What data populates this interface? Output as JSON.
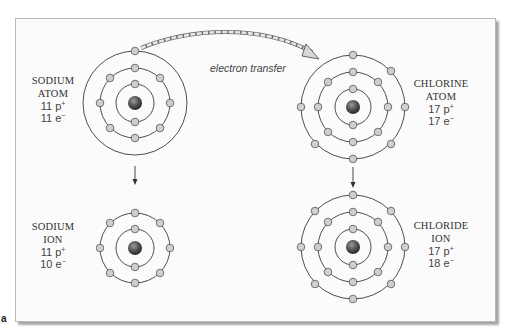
{
  "figure": {
    "panel_letter": "a",
    "transfer_caption": "electron transfer",
    "colors": {
      "orbit": "#3a3a3a",
      "electron_fill": "#cfcfcf",
      "nucleus": "#555555",
      "frame_bg": "#fbfbfb"
    }
  },
  "atoms": {
    "sodium_atom": {
      "name_line1": "SODIUM",
      "name_line2": "ATOM",
      "protons": "11 p",
      "proton_charge": "+",
      "electrons": "11 e",
      "electron_charge": "−",
      "shells": [
        2,
        8,
        1
      ]
    },
    "chlorine_atom": {
      "name_line1": "CHLORINE",
      "name_line2": "ATOM",
      "protons": "17 p",
      "proton_charge": "+",
      "electrons": "17 e",
      "electron_charge": "−",
      "shells": [
        2,
        8,
        7
      ]
    },
    "sodium_ion": {
      "name_line1": "SODIUM",
      "name_line2": "ION",
      "protons": "11 p",
      "proton_charge": "+",
      "electrons": "10 e",
      "electron_charge": "−",
      "shells": [
        2,
        8
      ]
    },
    "chloride_ion": {
      "name_line1": "CHLORIDE",
      "name_line2": "ION",
      "protons": "17 p",
      "proton_charge": "+",
      "electrons": "18 e",
      "electron_charge": "−",
      "shells": [
        2,
        8,
        8
      ]
    }
  }
}
